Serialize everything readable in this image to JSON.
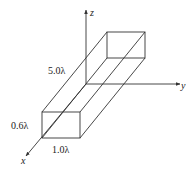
{
  "diagram": {
    "type": "3d-rectangular-waveguide",
    "axes": {
      "x": {
        "label": "x"
      },
      "y": {
        "label": "y"
      },
      "z": {
        "label": "z"
      }
    },
    "dimensions": {
      "length": "5.0λ",
      "height": "0.6λ",
      "width": "1.0λ"
    },
    "colors": {
      "line": "#333333",
      "background": "#ffffff"
    }
  }
}
